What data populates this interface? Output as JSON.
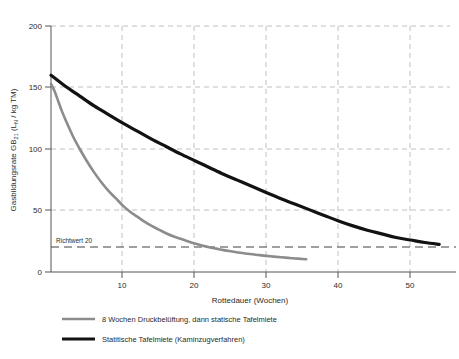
{
  "chart_data": {
    "type": "line",
    "title": "",
    "xlabel": "Rottedauer (Wochen)",
    "ylabel_full": "Gasbildungsrate GB21 (LN / kg TM)",
    "ylabel_main": "Gasbildungsrate GB",
    "ylabel_sub1": "21",
    "ylabel_mid": " (L",
    "ylabel_sub2": "N",
    "ylabel_tail": " / kg TM)",
    "xlim": [
      0,
      55.5
    ],
    "ylim": [
      0,
      200
    ],
    "xticks": [
      10,
      20,
      30,
      40,
      50
    ],
    "xtick_labels": [
      "10",
      "20",
      "30",
      "40",
      "50"
    ],
    "yticks": [
      0,
      50,
      100,
      150,
      200
    ],
    "ytick_labels": [
      "0",
      "50",
      "100",
      "150",
      "200"
    ],
    "grid": true,
    "grid_style": "dashed",
    "legend_position": "below",
    "annotations": [
      {
        "name": "richtwert",
        "label": "Richtwert 20",
        "value": 20,
        "style": "dashed-reference-line"
      }
    ],
    "series": [
      {
        "name": "8 Wochen Druckbelüftung, dann statische Tafelmiete",
        "color": "#8c8c8c",
        "width": 2.6,
        "x": [
          0,
          0.5,
          1,
          1.5,
          2,
          3,
          4,
          5,
          6,
          7,
          8,
          9,
          10,
          11,
          12,
          13,
          14,
          15,
          16,
          17,
          18,
          19,
          20,
          21,
          22,
          23,
          24,
          25,
          26,
          27,
          28,
          29,
          30,
          31,
          32,
          33,
          34,
          35,
          35.5
        ],
        "y": [
          153,
          147,
          139,
          131,
          124,
          111,
          100,
          90,
          81,
          73,
          66,
          60,
          54,
          49,
          45,
          41,
          37.5,
          34.5,
          31.5,
          29,
          27,
          25,
          23.2,
          21.6,
          20.2,
          19,
          17.8,
          16.8,
          15.9,
          15.1,
          14.4,
          13.7,
          13.1,
          12.5,
          12,
          11.5,
          11,
          10.6,
          10.4
        ]
      },
      {
        "name": "Statitische Tafelmiete (Kaminzugverfahren)",
        "color": "#121212",
        "width": 3.2,
        "x": [
          0,
          2,
          4,
          6,
          8,
          10,
          12,
          14,
          16,
          18,
          20,
          22,
          24,
          26,
          28,
          30,
          32,
          34,
          36,
          38,
          40,
          42,
          44,
          46,
          48,
          50,
          52,
          54
        ],
        "y": [
          160,
          151,
          143,
          135,
          128,
          121,
          114.5,
          108,
          102,
          96,
          90.5,
          85,
          79.5,
          74.5,
          69.5,
          64.5,
          59.5,
          55,
          50.5,
          46,
          41.5,
          37.5,
          34,
          31,
          28,
          26,
          24,
          22.5
        ]
      }
    ]
  },
  "legend": {
    "items": [
      {
        "label": "8 Wochen Druckbelüftung, dann statische Tafelmiete",
        "color": "#8c8c8c",
        "width": 2.6
      },
      {
        "label": "Statitische Tafelmiete (Kaminzugverfahren)",
        "color": "#121212",
        "width": 3.2
      }
    ]
  },
  "colors": {
    "background": "#ffffff",
    "axis": "#555555",
    "grid": "#b0b0b0",
    "reference_line": "#2b2b2b",
    "text": "#2b2b2b"
  }
}
